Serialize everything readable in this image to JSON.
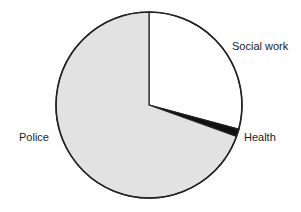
{
  "chart_data": {
    "type": "pie",
    "title": "",
    "categories": [
      "Social work",
      "Health",
      "Police"
    ],
    "values": [
      29.2,
      1.3,
      69.5
    ],
    "colors": [
      "#ffffff",
      "#111111",
      "#e2e2e2"
    ],
    "start_angle": "12 o'clock",
    "direction": "clockwise",
    "legend": "none (direct labels)",
    "labels": {
      "social_work": "Social work",
      "health": "Health",
      "police": "Police"
    }
  }
}
